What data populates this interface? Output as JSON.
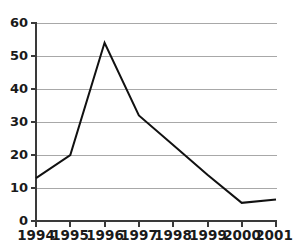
{
  "chart_data": {
    "type": "line",
    "title": "",
    "subtitle": "",
    "xlabel": "",
    "ylabel": "",
    "categories": [
      "1994",
      "1995",
      "1996",
      "1997",
      "1998",
      "1999",
      "2000",
      "2001"
    ],
    "x": [
      1994,
      1995,
      1996,
      1997,
      1998,
      1999,
      2000,
      2001
    ],
    "values": [
      13,
      20,
      54,
      32,
      23,
      14,
      5.5,
      6.5
    ],
    "series": [
      {
        "name": "",
        "values": [
          13,
          20,
          54,
          32,
          23,
          14,
          5.5,
          6.5
        ],
        "color": "#111111"
      }
    ],
    "ylim": [
      0,
      60
    ],
    "yticks": [
      0,
      10,
      20,
      30,
      40,
      50,
      60
    ],
    "ytick_labels": [
      "0",
      "10",
      "20",
      "30",
      "40",
      "50",
      "60"
    ],
    "xtick_labels": [
      "1994",
      "1995",
      "1996",
      "1997",
      "1998",
      "1999",
      "2000",
      "2001"
    ],
    "grid": "horizontal",
    "legend": "none",
    "annotations": [],
    "colors": {
      "line": "#111111",
      "axis": "#3a3a3a",
      "grid": "#a8a8a8",
      "background": "#ffffff",
      "label": "#1a1a1a"
    }
  }
}
